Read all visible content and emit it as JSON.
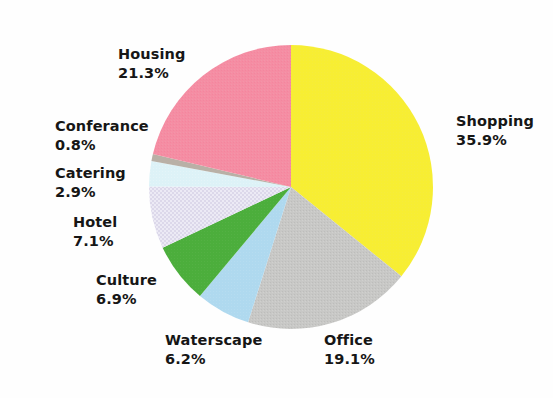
{
  "chart_data": {
    "type": "pie",
    "title": "",
    "subtitle": "",
    "xlabel": "",
    "ylabel": "",
    "legend_position": "none",
    "grid": false,
    "labels_show_percent": true,
    "start_angle_deg": 0,
    "direction": "clockwise",
    "categories": [
      "Shopping",
      "Office",
      "Waterscape",
      "Culture",
      "Hotel",
      "Catering",
      "Conferance",
      "Housing"
    ],
    "values": [
      35.9,
      19.1,
      6.2,
      6.9,
      7.1,
      2.9,
      0.8,
      21.3
    ],
    "slices": [
      {
        "label": "Shopping",
        "value": 35.9,
        "value_text": "35.9%",
        "color": "#f7ee33",
        "pattern": "solid"
      },
      {
        "label": "Office",
        "value": 19.1,
        "value_text": "19.1%",
        "color": "#c6c6c6",
        "pattern": "texture"
      },
      {
        "label": "Waterscape",
        "value": 6.2,
        "value_text": "6.2%",
        "color": "#afd9ef",
        "pattern": "solid"
      },
      {
        "label": "Culture",
        "value": 6.9,
        "value_text": "6.9%",
        "color": "#4cae3c",
        "pattern": "solid"
      },
      {
        "label": "Hotel",
        "value": 7.1,
        "value_text": "7.1%",
        "color": "#e6e2f0",
        "pattern": "checker"
      },
      {
        "label": "Catering",
        "value": 2.9,
        "value_text": "2.9%",
        "color": "#ddf2f7",
        "pattern": "solid"
      },
      {
        "label": "Conferance",
        "value": 0.8,
        "value_text": "0.8%",
        "color": "#b9b0a6",
        "pattern": "solid"
      },
      {
        "label": "Housing",
        "value": 21.3,
        "value_text": "21.3%",
        "color": "#f58da3",
        "pattern": "texture"
      }
    ],
    "total": 100.2
  },
  "labels": {
    "shopping": {
      "name": "Shopping",
      "value": "35.9%"
    },
    "housing": {
      "name": "Housing",
      "value": "21.3%"
    },
    "conferance": {
      "name": "Conferance",
      "value": "0.8%"
    },
    "catering": {
      "name": "Catering",
      "value": "2.9%"
    },
    "hotel": {
      "name": "Hotel",
      "value": "7.1%"
    },
    "culture": {
      "name": "Culture",
      "value": "6.9%"
    },
    "waterscape": {
      "name": "Waterscape",
      "value": "6.2%"
    },
    "office": {
      "name": "Office",
      "value": "19.1%"
    }
  },
  "geometry": {
    "center_x": 291,
    "center_y": 187,
    "radius": 142
  },
  "colors": {
    "background": "#fefefe",
    "text": "#161616",
    "shopping": "#f7ee33",
    "office": "#c6c6c6",
    "waterscape": "#afd9ef",
    "culture": "#4cae3c",
    "hotel": "#e6e2f0",
    "catering": "#ddf2f7",
    "conferance": "#b9b0a6",
    "housing": "#f58da3"
  }
}
